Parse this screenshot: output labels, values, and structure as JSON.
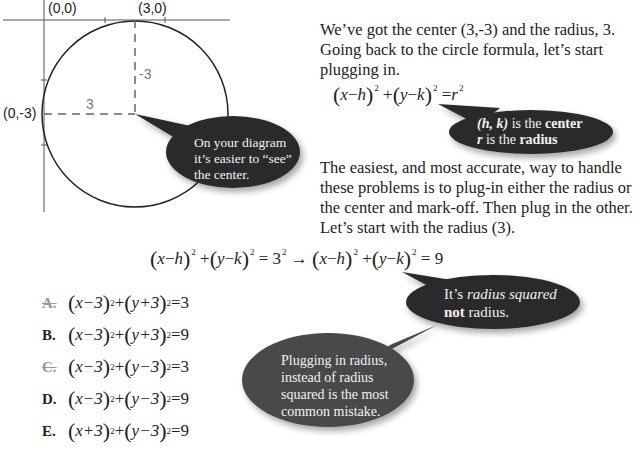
{
  "diagram": {
    "labels": {
      "origin": "(0,0)",
      "top_point": "(3,0)",
      "left_point": "(0,-3)",
      "vertical_dim": "-3",
      "horizontal_dim": "3"
    },
    "center_px": [
      135,
      114
    ],
    "radius_px": 92,
    "bubble": {
      "line1": "On your diagram",
      "line2": "it’s easier to “see”",
      "line3": "the center.",
      "color": "#2b2b2b"
    }
  },
  "intro": {
    "line1": "We’ve got the center (3,-3) and the radius, 3.",
    "line2": "Going back to the circle formula, let’s start",
    "line3": "plugging in."
  },
  "formula": {
    "x": "x",
    "h": "h",
    "y": "y",
    "k": "k",
    "r": "r",
    "exp": "2"
  },
  "formula_bubble": {
    "hk": "(h, k)",
    "is_the": " is the ",
    "center": "center",
    "r": "r",
    "is_the2": " is the ",
    "radius": "radius",
    "color": "#2b2b2b"
  },
  "explanation": {
    "line1": "The easiest, and most accurate, way to handle",
    "line2": "these problems is to plug-in either the radius or",
    "line3": "the center and mark-off.  Then plug in the other.",
    "line4": "Let’s start with the radius (3)."
  },
  "worked_equation": {
    "lhs": "= 3",
    "arrow": "→",
    "rhs": "= 9"
  },
  "choices": [
    {
      "letter": "A.",
      "struck": true,
      "a": "x−3",
      "b": "y+3",
      "rhs": "=3"
    },
    {
      "letter": "B.",
      "struck": false,
      "a": "x−3",
      "b": "y+3",
      "rhs": "=9"
    },
    {
      "letter": "C.",
      "struck": true,
      "a": "x−3",
      "b": "y−3",
      "rhs": "=3"
    },
    {
      "letter": "D.",
      "struck": false,
      "a": "x−3",
      "b": "y−3",
      "rhs": "=9"
    },
    {
      "letter": "E.",
      "struck": false,
      "a": "x+3",
      "b": "y−3",
      "rhs": "=9"
    }
  ],
  "radius_bubble": {
    "its": "It’s ",
    "emph": "radius squared",
    "not": "not",
    "rest": " radius.",
    "color": "#2b2b2b"
  },
  "mistake_bubble": {
    "line1": "Plugging in radius,",
    "line2": "instead of radius",
    "line3": "squared is the most",
    "line4": "common mistake.",
    "color": "#4a4a4a"
  }
}
